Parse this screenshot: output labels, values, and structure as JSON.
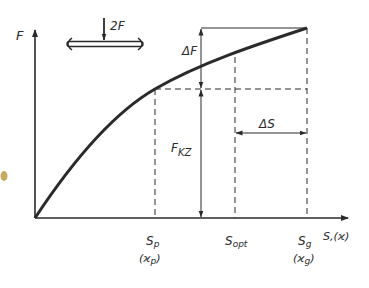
{
  "diagram": {
    "axes": {
      "y_label": "F",
      "x_label": "S,(ϰ)"
    },
    "load_symbol": {
      "force_label": "2F"
    },
    "dimensions": {
      "delta_f": "ΔF",
      "f_kz_main": "F",
      "f_kz_sub": "KZ",
      "delta_s": "ΔS"
    },
    "x_ticks": [
      {
        "main": "S",
        "sub": "p",
        "paren_main": "(ϰ",
        "paren_sub": "p",
        "paren_close": ")"
      },
      {
        "main": "S",
        "sub": "opt"
      },
      {
        "main": "S",
        "sub": "g",
        "paren_main": "(ϰ",
        "paren_sub": "g",
        "paren_close": ")"
      }
    ],
    "colors": {
      "ink": "#2a2a2a",
      "stain": "#b8963a",
      "background": "#ffffff"
    }
  }
}
